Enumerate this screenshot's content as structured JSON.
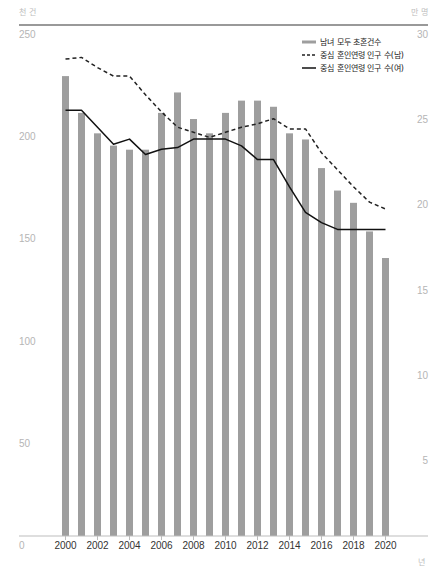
{
  "chart_data": {
    "type": "bar+line",
    "title": "",
    "left_unit_label": "천 건",
    "right_unit_label": "만 명",
    "x_unit_label": "년",
    "xlabel": "년",
    "ylabel_left": "천 건",
    "ylabel_right": "만 명",
    "ylim_left": [
      0,
      250
    ],
    "ylim_right": [
      0,
      30
    ],
    "left_ticks": [
      0,
      50,
      100,
      150,
      200,
      250
    ],
    "right_ticks": [
      5,
      10,
      15,
      20,
      25,
      30
    ],
    "x_tick_labels": [
      "2000",
      "2002",
      "2004",
      "2006",
      "2008",
      "2010",
      "2012",
      "2014",
      "2016",
      "2018",
      "2020"
    ],
    "grid": false,
    "legend_position": "top-right",
    "categories": [
      "2000",
      "2001",
      "2002",
      "2003",
      "2004",
      "2005",
      "2006",
      "2007",
      "2008",
      "2009",
      "2010",
      "2011",
      "2012",
      "2013",
      "2014",
      "2015",
      "2016",
      "2017",
      "2018",
      "2019",
      "2020"
    ],
    "series": [
      {
        "name": "남녀 모두 초혼건수",
        "type": "bar",
        "axis": "left",
        "color": "#9e9e9e",
        "values": [
          225,
          207,
          197,
          191,
          189,
          189,
          207,
          217,
          204,
          197,
          207,
          213,
          213,
          210,
          197,
          194,
          180,
          169,
          163,
          149,
          136
        ]
      },
      {
        "name": "중심 혼인연령 인구 수(남)",
        "type": "line",
        "style": "dashed",
        "axis": "right",
        "color": "#222222",
        "values": [
          28.0,
          28.1,
          27.5,
          27.0,
          27.0,
          25.9,
          24.9,
          24.0,
          23.7,
          23.4,
          23.7,
          24.0,
          24.2,
          24.5,
          23.9,
          23.9,
          22.5,
          21.5,
          20.5,
          19.6,
          19.2
        ]
      },
      {
        "name": "중심 혼인연령 인구 수(여)",
        "type": "line",
        "style": "solid",
        "axis": "right",
        "color": "#111111",
        "values": [
          25.0,
          25.0,
          24.0,
          23.0,
          23.3,
          22.4,
          22.7,
          22.8,
          23.3,
          23.3,
          23.3,
          22.9,
          22.1,
          22.1,
          20.5,
          19.0,
          18.4,
          18.0,
          18.0,
          18.0,
          18.0
        ]
      }
    ]
  }
}
